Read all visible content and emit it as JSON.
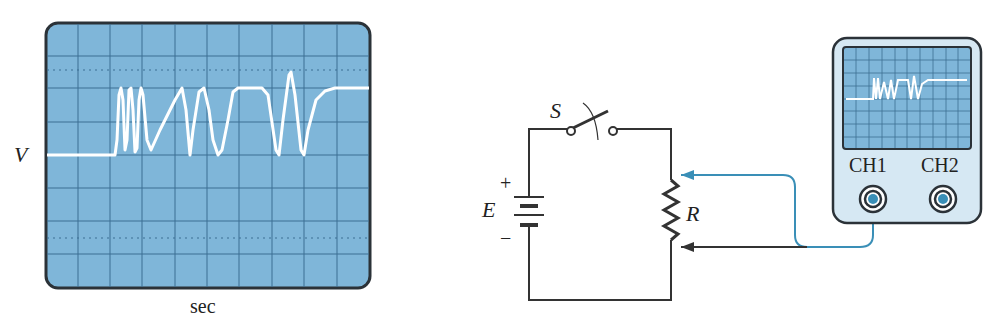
{
  "left_scope": {
    "y_label": "V",
    "x_label": "sec",
    "screen_color": "#7fb6d9",
    "bezel_color": "#2b3238",
    "trace_color": "#ffffff",
    "grid": {
      "columns": 10,
      "rows": 8
    }
  },
  "circuit": {
    "switch_label": "S",
    "battery_label": "E",
    "battery_plus": "+",
    "battery_minus": "−",
    "resistor_label": "R",
    "wire_color": "#333333",
    "probe_color": "#3a8fb7"
  },
  "small_scope": {
    "channel1_label": "CH1",
    "channel2_label": "CH2",
    "case_color": "#d6e8f3",
    "screen_color": "#7fb6d9"
  }
}
